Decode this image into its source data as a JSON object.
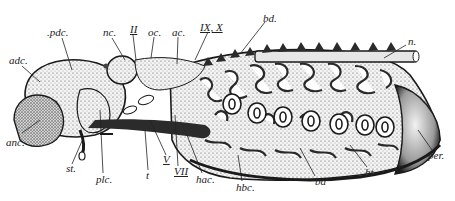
{
  "figure": {
    "colors": {
      "ink": "#1a1a1a",
      "stipple": "#555555",
      "paper": "#ffffff",
      "shade": "#2b2b2b"
    }
  },
  "labels": [
    {
      "id": "pdc",
      "text": ".pdc.",
      "x": 47,
      "y": 27
    },
    {
      "id": "nc",
      "text": "nc.",
      "x": 103,
      "y": 27
    },
    {
      "id": "II",
      "text": "II",
      "x": 130,
      "y": 24
    },
    {
      "id": "oc",
      "text": "oc.",
      "x": 148,
      "y": 27
    },
    {
      "id": "ac",
      "text": "ac.",
      "x": 172,
      "y": 27
    },
    {
      "id": "IX_X",
      "text": "IX, X",
      "x": 200,
      "y": 22
    },
    {
      "id": "bd",
      "text": "bd.",
      "x": 263,
      "y": 13
    },
    {
      "id": "n",
      "text": "n.",
      "x": 408,
      "y": 38
    },
    {
      "id": "adc",
      "text": "adc.",
      "x": 9,
      "y": 55
    },
    {
      "id": "anc",
      "text": "anc.",
      "x": 6,
      "y": 139
    },
    {
      "id": "st",
      "text": "st.",
      "x": 67,
      "y": 165
    },
    {
      "id": "plc",
      "text": "plc.",
      "x": 97,
      "y": 174
    },
    {
      "id": "t",
      "text": "t",
      "x": 146,
      "y": 172
    },
    {
      "id": "V",
      "text": "V",
      "x": 164,
      "y": 156
    },
    {
      "id": "VII",
      "text": "VII",
      "x": 175,
      "y": 168
    },
    {
      "id": "hac",
      "text": "hac.",
      "x": 197,
      "y": 174
    },
    {
      "id": "hbc",
      "text": "hbc.",
      "x": 236,
      "y": 182
    },
    {
      "id": "ba",
      "text": "ba",
      "x": 315,
      "y": 176
    },
    {
      "id": "ht",
      "text": "ht.",
      "x": 365,
      "y": 168
    },
    {
      "id": "per",
      "text": "per.",
      "x": 432,
      "y": 152
    }
  ]
}
